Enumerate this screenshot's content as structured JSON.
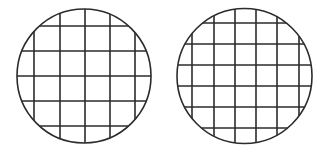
{
  "background": "#ffffff",
  "stroke_color": "#2b2b2b",
  "stroke_width": 1.6,
  "figures": [
    {
      "name": "left-grid-circle",
      "shape": "circle",
      "cx": 84,
      "cy": 76,
      "r": 67,
      "grid_lines": {
        "vertical_x": [
          34,
          60,
          85,
          110,
          135
        ],
        "horizontal_y": [
          26,
          51,
          76,
          101,
          126
        ]
      },
      "grid_cells_across": 6,
      "grid_spacing": 25
    },
    {
      "name": "right-grid-circle",
      "shape": "circle",
      "cx": 244.5,
      "cy": 76,
      "r": 67.5,
      "grid_lines": {
        "vertical_x": [
          192,
          214,
          235,
          256,
          277,
          299
        ],
        "horizontal_y": [
          23,
          44,
          65,
          86,
          107,
          128
        ]
      },
      "grid_cells_across": 7,
      "grid_spacing": 21
    }
  ]
}
